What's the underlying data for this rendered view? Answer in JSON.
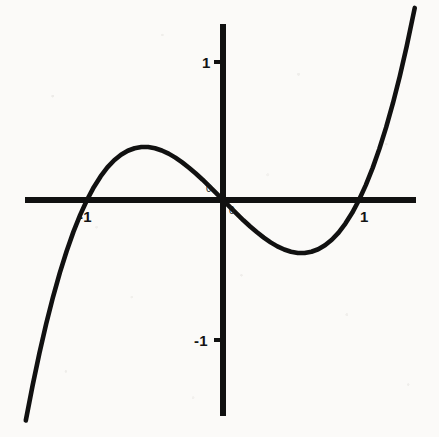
{
  "figure": {
    "background_color": "#fbfaf8",
    "ink_color": "#111111",
    "width": 439,
    "height": 437
  },
  "axes": {
    "origin_px": {
      "x": 223,
      "y": 200
    },
    "x_unit_px": 136,
    "y_unit_px": 138,
    "x_axis_px": {
      "x1": 25,
      "x2": 416,
      "y": 200,
      "stroke_width": 6
    },
    "y_axis_px": {
      "y1": 24,
      "y2": 416,
      "x": 223,
      "stroke_width": 6
    }
  },
  "labels": {
    "y_tick_pos": "1",
    "y_tick_neg": "-1",
    "x_tick_pos": "1",
    "x_tick_neg": "-1",
    "origin_upper": "0",
    "origin_lower": "0"
  },
  "chart_data": {
    "type": "line",
    "title": "",
    "subtitle": "",
    "xlabel": "",
    "ylabel": "",
    "function": "y = x^3 - x",
    "grid": false,
    "legend": null,
    "xlim": [
      -1.45,
      1.41
    ],
    "ylim": [
      -1.56,
      1.27
    ],
    "x_ticks": [
      -1,
      1
    ],
    "x_tick_labels": [
      "-1",
      "1"
    ],
    "y_ticks": [
      -1,
      1
    ],
    "y_tick_labels": [
      "-1",
      "1"
    ],
    "roots": [
      -1,
      0,
      1
    ],
    "local_maximum": {
      "x": -0.577,
      "y": 0.385
    },
    "local_minimum": {
      "x": 0.577,
      "y": -0.385
    },
    "annotations": [
      {
        "text": "0",
        "x": -0.07,
        "y": 0.09
      },
      {
        "text": "0",
        "x": 0.06,
        "y": -0.1
      }
    ],
    "series": [
      {
        "name": "y = x^3 - x",
        "color": "#111111",
        "x": [
          -1.45,
          -1.4,
          -1.35,
          -1.3,
          -1.25,
          -1.2,
          -1.15,
          -1.1,
          -1.05,
          -1.0,
          -0.95,
          -0.9,
          -0.85,
          -0.8,
          -0.75,
          -0.7,
          -0.65,
          -0.6,
          -0.55,
          -0.5,
          -0.45,
          -0.4,
          -0.35,
          -0.3,
          -0.25,
          -0.2,
          -0.15,
          -0.1,
          -0.05,
          0.0,
          0.05,
          0.1,
          0.15,
          0.2,
          0.25,
          0.3,
          0.35,
          0.4,
          0.45,
          0.5,
          0.55,
          0.6,
          0.65,
          0.7,
          0.75,
          0.8,
          0.85,
          0.9,
          0.95,
          1.0,
          1.05,
          1.1,
          1.15,
          1.2,
          1.25,
          1.3,
          1.35,
          1.41
        ],
        "y": [
          -1.598,
          -1.344,
          -1.11,
          -0.897,
          -0.703,
          -0.528,
          -0.371,
          -0.231,
          -0.108,
          0.0,
          0.093,
          0.171,
          0.236,
          0.288,
          0.328,
          0.357,
          0.375,
          0.384,
          0.384,
          0.375,
          0.359,
          0.336,
          0.307,
          0.273,
          0.234,
          0.192,
          0.147,
          0.099,
          0.05,
          0.0,
          -0.05,
          -0.099,
          -0.147,
          -0.192,
          -0.234,
          -0.273,
          -0.307,
          -0.336,
          -0.359,
          -0.375,
          -0.384,
          -0.384,
          -0.375,
          -0.357,
          -0.328,
          -0.288,
          -0.236,
          -0.171,
          -0.093,
          0.0,
          0.108,
          0.231,
          0.371,
          0.528,
          0.703,
          0.897,
          1.11,
          1.392
        ]
      }
    ]
  }
}
